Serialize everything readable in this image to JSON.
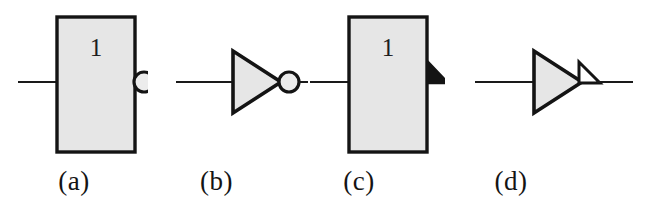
{
  "figure": {
    "background_color": "#ffffff",
    "width": 665,
    "height": 212,
    "stroke_color": "#141414",
    "body_fill_color": "#e6e6e6",
    "wire_color": "#1a1a1a"
  },
  "panels": [
    {
      "id": "a",
      "label": "(a)",
      "symbol_style": "iec-rectangular",
      "body_shape": "rectangle",
      "qualifier_symbol": "1",
      "negation_indicator": "bubble",
      "has_input_wire": true,
      "has_output_wire": true
    },
    {
      "id": "b",
      "label": "(b)",
      "symbol_style": "ansi-distinctive-shape",
      "body_shape": "triangle",
      "qualifier_symbol": "",
      "negation_indicator": "bubble",
      "has_input_wire": true,
      "has_output_wire": true
    },
    {
      "id": "c",
      "label": "(c)",
      "symbol_style": "iec-rectangular",
      "body_shape": "rectangle",
      "qualifier_symbol": "1",
      "negation_indicator": "polarity-wedge-filled",
      "has_input_wire": true,
      "has_output_wire": true
    },
    {
      "id": "d",
      "label": "(d)",
      "symbol_style": "ansi-distinctive-shape",
      "body_shape": "triangle",
      "qualifier_symbol": "",
      "negation_indicator": "polarity-wedge-outline",
      "has_input_wire": true,
      "has_output_wire": true
    }
  ]
}
